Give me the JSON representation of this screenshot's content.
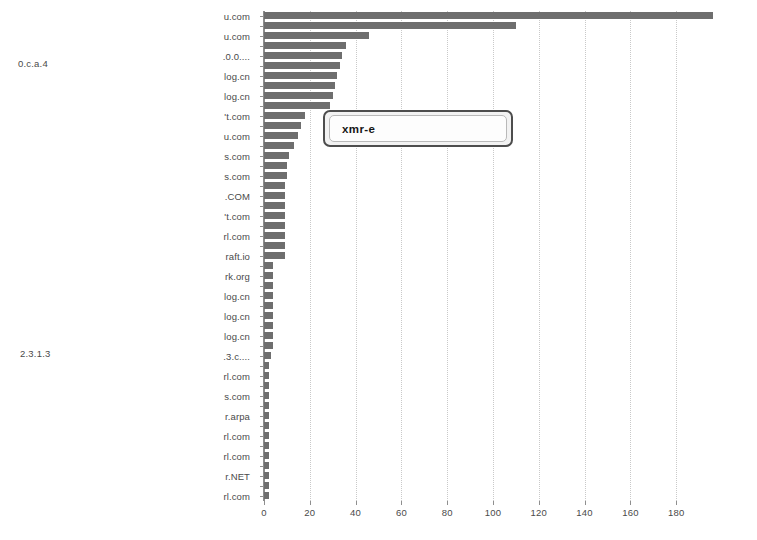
{
  "annotations": {
    "upper_left": "0.c.a.4",
    "lower_left": "2.3.1.3"
  },
  "tooltip": {
    "text": "xmr-e",
    "visible": true
  },
  "chart_data": {
    "type": "bar",
    "orientation": "horizontal",
    "title": "",
    "xlabel": "",
    "ylabel": "",
    "xlim": [
      0,
      200
    ],
    "ylim": null,
    "grid": true,
    "grid_axis": "x",
    "legend": null,
    "bar_color": "#6e6e6e",
    "xticks": [
      0,
      20,
      40,
      60,
      80,
      100,
      120,
      140,
      160,
      180
    ],
    "xticklabels": [
      "0",
      "20",
      "40",
      "60",
      "80",
      "100",
      "120",
      "140",
      "160",
      "180"
    ],
    "categories": [
      "u.com",
      "",
      "u.com",
      "",
      ".0.0....",
      "",
      "log.cn",
      "",
      "log.cn",
      "",
      "'t.com",
      "",
      "u.com",
      "",
      "s.com",
      "",
      "s.com",
      "",
      ".COM",
      "",
      "'t.com",
      "",
      "rl.com",
      "",
      "raft.io",
      "",
      "rk.org",
      "",
      "log.cn",
      "",
      "log.cn",
      "",
      "log.cn",
      "",
      ".3.c....",
      "",
      "rl.com",
      "",
      "s.com",
      "",
      "r.arpa",
      "",
      "rl.com",
      "",
      "rl.com",
      "",
      "r.NET",
      "",
      "rl.com"
    ],
    "visible_tick_labels": [
      "u.com",
      "u.com",
      ".0.0....",
      "log.cn",
      "log.cn",
      "'t.com",
      "u.com",
      "s.com",
      "s.com",
      ".COM",
      "'t.com",
      "rl.com",
      "raft.io",
      "rk.org",
      "log.cn",
      "log.cn",
      "log.cn",
      ".3.c....",
      "rl.com",
      "s.com",
      "r.arpa",
      "rl.com",
      "rl.com",
      "r.NET",
      "rl.com"
    ],
    "values": [
      196,
      110,
      46,
      36,
      34,
      33,
      32,
      31,
      30,
      29,
      18,
      16,
      15,
      13,
      11,
      10,
      10,
      9,
      9,
      9,
      9,
      9,
      9,
      9,
      9,
      4,
      4,
      4,
      4,
      4,
      4,
      4,
      4,
      4,
      3,
      2,
      2,
      2,
      2,
      2,
      2,
      2,
      2,
      2,
      2,
      2,
      2,
      2,
      2
    ]
  }
}
